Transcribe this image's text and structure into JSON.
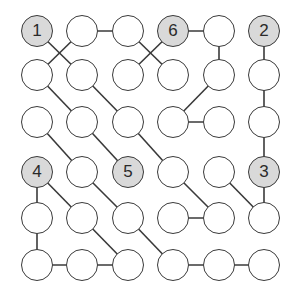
{
  "puzzle": {
    "rows": 6,
    "cols": 6,
    "col_x": [
      37,
      82,
      128,
      173,
      219,
      264
    ],
    "row_y": [
      31,
      75,
      122,
      172,
      218,
      265
    ],
    "colors": {
      "line": "#3a3a3a",
      "given_fill": "#d9d9d9",
      "empty_fill": "#ffffff"
    },
    "givens": [
      {
        "r": 0,
        "c": 0,
        "label": "1"
      },
      {
        "r": 0,
        "c": 3,
        "label": "6"
      },
      {
        "r": 0,
        "c": 5,
        "label": "2"
      },
      {
        "r": 3,
        "c": 0,
        "label": "4"
      },
      {
        "r": 3,
        "c": 2,
        "label": "5"
      },
      {
        "r": 3,
        "c": 5,
        "label": "3"
      }
    ],
    "edges": [
      [
        [
          0,
          1
        ],
        [
          0,
          2
        ]
      ],
      [
        [
          0,
          3
        ],
        [
          0,
          4
        ]
      ],
      [
        [
          0,
          0
        ],
        [
          1,
          1
        ]
      ],
      [
        [
          0,
          1
        ],
        [
          1,
          0
        ]
      ],
      [
        [
          0,
          2
        ],
        [
          1,
          3
        ]
      ],
      [
        [
          0,
          3
        ],
        [
          1,
          2
        ]
      ],
      [
        [
          0,
          4
        ],
        [
          1,
          4
        ]
      ],
      [
        [
          0,
          5
        ],
        [
          1,
          5
        ]
      ],
      [
        [
          1,
          0
        ],
        [
          2,
          1
        ]
      ],
      [
        [
          1,
          1
        ],
        [
          2,
          2
        ]
      ],
      [
        [
          1,
          4
        ],
        [
          2,
          3
        ]
      ],
      [
        [
          1,
          5
        ],
        [
          2,
          5
        ]
      ],
      [
        [
          2,
          3
        ],
        [
          2,
          4
        ]
      ],
      [
        [
          2,
          0
        ],
        [
          3,
          1
        ]
      ],
      [
        [
          2,
          1
        ],
        [
          3,
          2
        ]
      ],
      [
        [
          2,
          2
        ],
        [
          3,
          3
        ]
      ],
      [
        [
          2,
          5
        ],
        [
          3,
          5
        ]
      ],
      [
        [
          3,
          0
        ],
        [
          4,
          0
        ]
      ],
      [
        [
          3,
          0
        ],
        [
          4,
          1
        ]
      ],
      [
        [
          3,
          1
        ],
        [
          4,
          2
        ]
      ],
      [
        [
          3,
          3
        ],
        [
          4,
          4
        ]
      ],
      [
        [
          3,
          4
        ],
        [
          4,
          5
        ]
      ],
      [
        [
          3,
          5
        ],
        [
          4,
          5
        ]
      ],
      [
        [
          4,
          3
        ],
        [
          4,
          4
        ]
      ],
      [
        [
          4,
          0
        ],
        [
          5,
          0
        ]
      ],
      [
        [
          4,
          1
        ],
        [
          5,
          2
        ]
      ],
      [
        [
          4,
          2
        ],
        [
          5,
          3
        ]
      ],
      [
        [
          5,
          0
        ],
        [
          5,
          1
        ]
      ],
      [
        [
          5,
          1
        ],
        [
          5,
          2
        ]
      ],
      [
        [
          5,
          3
        ],
        [
          5,
          4
        ]
      ],
      [
        [
          5,
          4
        ],
        [
          5,
          5
        ]
      ]
    ]
  }
}
